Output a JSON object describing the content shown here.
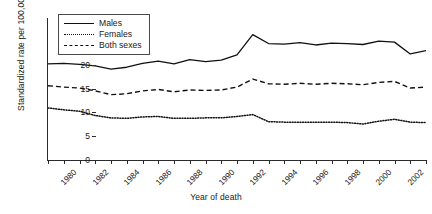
{
  "chart_data": {
    "type": "line",
    "title": "",
    "xlabel": "Year of death",
    "ylabel": "Standardized rate per 100,000",
    "xlim": [
      1980,
      2004
    ],
    "ylim": [
      0,
      30
    ],
    "yticks": [
      0,
      5,
      10,
      15,
      20,
      25,
      30
    ],
    "xticks": [
      1980,
      1981,
      1982,
      1983,
      1984,
      1985,
      1986,
      1987,
      1988,
      1989,
      1990,
      1991,
      1992,
      1993,
      1994,
      1995,
      1996,
      1997,
      1998,
      1999,
      2000,
      2001,
      2002,
      2003,
      2004
    ],
    "xtick_labels_shown": [
      "1980",
      "1982",
      "1984",
      "1986",
      "1988",
      "1990",
      "1992",
      "1994",
      "1996",
      "1998",
      "2000",
      "2002",
      "2004"
    ],
    "grid": false,
    "legend_position": "top-left",
    "x": [
      1980,
      1981,
      1982,
      1983,
      1984,
      1985,
      1986,
      1987,
      1988,
      1989,
      1990,
      1991,
      1992,
      1993,
      1994,
      1995,
      1996,
      1997,
      1998,
      1999,
      2000,
      2001,
      2002,
      2003,
      2004
    ],
    "series": [
      {
        "name": "Males",
        "style": "solid",
        "color": "#111111",
        "values": [
          20.3,
          20.4,
          20.2,
          19.9,
          19.2,
          19.6,
          20.4,
          20.9,
          20.3,
          21.2,
          20.8,
          21.1,
          22.2,
          26.5,
          24.6,
          24.5,
          24.8,
          24.3,
          24.7,
          24.6,
          24.4,
          25.1,
          24.9,
          22.4,
          23.1
        ]
      },
      {
        "name": "Females",
        "style": "dotted",
        "color": "#111111",
        "values": [
          11.0,
          10.6,
          10.3,
          9.4,
          8.9,
          8.8,
          9.1,
          9.2,
          8.8,
          8.8,
          8.9,
          8.9,
          9.2,
          9.6,
          8.1,
          8.0,
          8.0,
          8.0,
          8.0,
          7.9,
          7.6,
          8.2,
          8.6,
          8.0,
          7.9
        ]
      },
      {
        "name": "Both sexes",
        "style": "dashed",
        "color": "#111111",
        "values": [
          15.7,
          15.4,
          15.2,
          14.6,
          13.8,
          14.0,
          14.6,
          14.9,
          14.4,
          14.8,
          14.7,
          14.8,
          15.4,
          17.1,
          16.1,
          16.0,
          16.2,
          16.0,
          16.2,
          16.1,
          15.9,
          16.4,
          16.6,
          15.2,
          15.4
        ]
      }
    ]
  },
  "legend": {
    "items": [
      {
        "label": "Males",
        "style": "solid"
      },
      {
        "label": "Females",
        "style": "dotted"
      },
      {
        "label": "Both sexes",
        "style": "dashed"
      }
    ]
  }
}
